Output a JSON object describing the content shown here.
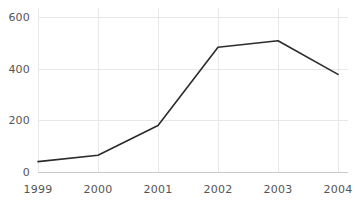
{
  "chart_data": {
    "type": "line",
    "title": "",
    "subtitle": "",
    "xlabel": "",
    "ylabel": "",
    "categories": [
      "1999",
      "2000",
      "2001",
      "2002",
      "2003",
      "2004"
    ],
    "x": [
      1999,
      2000,
      2001,
      2002,
      2003,
      2004
    ],
    "values": [
      40,
      65,
      180,
      483,
      508,
      378
    ],
    "series": [
      {
        "name": "",
        "values": [
          40,
          65,
          180,
          483,
          508,
          378
        ]
      }
    ],
    "xtick_labels": [
      "1999",
      "2000",
      "2001",
      "2002",
      "2003",
      "2004"
    ],
    "ytick_labels": [
      "0",
      "200",
      "400",
      "600"
    ],
    "yticks": [
      0,
      200,
      400,
      600
    ],
    "ylim": [
      0,
      600
    ],
    "xlim": [
      1999,
      2004
    ],
    "grid": "both-light",
    "legend": "none",
    "annotations": [],
    "colors": {
      "line": "#2b2b2b",
      "grid": "#e8e8e8",
      "axis": "#c9c9c9",
      "tick_text": "#555555",
      "background": "#ffffff"
    }
  },
  "axes": {
    "y_labels": [
      {
        "text": "600",
        "value": 600
      },
      {
        "text": "400",
        "value": 400
      },
      {
        "text": "200",
        "value": 200
      },
      {
        "text": "0",
        "value": 0
      }
    ],
    "x_labels": [
      {
        "text": "1999",
        "value": 1999
      },
      {
        "text": "2000",
        "value": 2000
      },
      {
        "text": "2001",
        "value": 2001
      },
      {
        "text": "2002",
        "value": 2002
      },
      {
        "text": "2003",
        "value": 2003
      },
      {
        "text": "2004",
        "value": 2004
      }
    ]
  }
}
